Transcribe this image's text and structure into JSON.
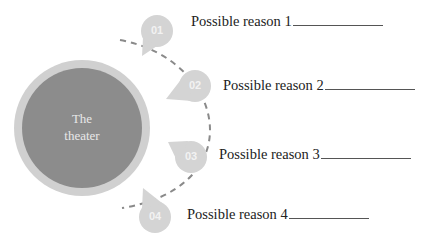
{
  "diagram": {
    "center": {
      "title_line1": "The",
      "title_line2": "theater"
    },
    "colors": {
      "center_fill": "#8c8c8c",
      "center_ring": "#cfcfcf",
      "marker_fill": "#d4d4d4",
      "dash": "#8a8a8a",
      "text": "#222222"
    },
    "items": [
      {
        "number": "01",
        "label": "Possible reason 1"
      },
      {
        "number": "02",
        "label": "Possible reason 2"
      },
      {
        "number": "03",
        "label": "Possible reason 3"
      },
      {
        "number": "04",
        "label": "Possible reason 4"
      }
    ]
  }
}
